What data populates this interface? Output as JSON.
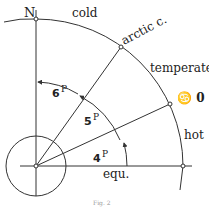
{
  "figure": {
    "caption": "Fig. 2",
    "pole_label": "N",
    "equator_label": "equ.",
    "zone_labels": {
      "cold": "cold",
      "temperate": "temperate",
      "hot": "hot"
    },
    "circle_labels": {
      "arctic": "arctic c.",
      "tropic": "♋ 0"
    },
    "angles": [
      {
        "name": "equator-to-tropic",
        "value": "4",
        "unit": "P",
        "degrees": 24
      },
      {
        "name": "tropic-to-arctic",
        "value": "5",
        "unit": "P",
        "degrees": 30
      },
      {
        "name": "arctic-to-pole",
        "value": "6",
        "unit": "P",
        "degrees": 36
      }
    ]
  }
}
